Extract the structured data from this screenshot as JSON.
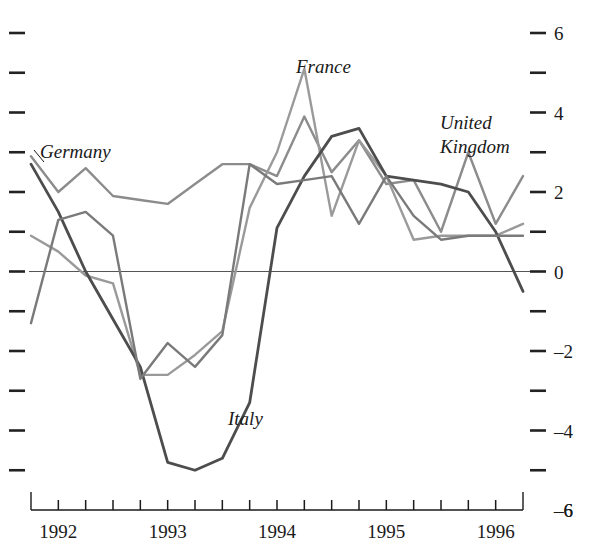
{
  "chart_data": {
    "type": "line",
    "title": "",
    "subtitle": "",
    "xlabel": "",
    "ylabel": "",
    "ylim": [
      -6,
      6
    ],
    "xlim": [
      1991.875,
      1996.375
    ],
    "grid": false,
    "legend_position": "inline-annotations",
    "y_ticks_major": [
      -6,
      -4,
      -2,
      0,
      2,
      4,
      6
    ],
    "y_ticks_minor": [
      -5,
      -3,
      -1,
      1,
      3,
      5
    ],
    "y_tick_labels": [
      "6",
      "4",
      "2",
      "0",
      "–2",
      "–4",
      "–6"
    ],
    "x_tick_labels": [
      "1992",
      "1993",
      "1994",
      "1995",
      "1996"
    ],
    "x_tick_values": [
      1992,
      1993,
      1994,
      1995,
      1996
    ],
    "x_minor_step": 0.25,
    "x": [
      1991.875,
      1992.125,
      1992.375,
      1992.625,
      1992.875,
      1993.125,
      1993.375,
      1993.625,
      1993.875,
      1994.125,
      1994.375,
      1994.625,
      1994.875,
      1995.125,
      1995.375,
      1995.625,
      1995.875,
      1996.125,
      1996.375
    ],
    "series": [
      {
        "name": "Germany",
        "color": "#8c8c8c",
        "width": 2.4,
        "values": [
          2.9,
          2.0,
          2.6,
          1.9,
          1.8,
          1.7,
          2.2,
          2.7,
          2.7,
          2.4,
          3.9,
          2.5,
          3.3,
          2.2,
          2.3,
          1.0,
          3.0,
          1.2,
          2.4
        ]
      },
      {
        "name": "France",
        "color": "#9a9a9a",
        "width": 2.4,
        "values": [
          0.9,
          0.5,
          -0.1,
          -0.3,
          -2.6,
          -2.6,
          -2.1,
          -1.5,
          1.6,
          3.0,
          5.1,
          1.4,
          3.3,
          2.4,
          0.8,
          0.9,
          0.9,
          0.9,
          1.2
        ]
      },
      {
        "name": "Italy",
        "color": "#4d4d4d",
        "width": 2.8,
        "values": [
          2.7,
          1.5,
          0.0,
          -1.2,
          -2.4,
          -4.8,
          -5.0,
          -4.7,
          -3.3,
          1.1,
          2.4,
          3.4,
          3.6,
          2.4,
          2.3,
          2.2,
          2.0,
          1.0,
          -0.5
        ]
      },
      {
        "name": "United Kingdom",
        "color": "#7a7a7a",
        "width": 2.4,
        "values": [
          -1.3,
          1.3,
          1.5,
          0.9,
          -2.7,
          -1.8,
          -2.4,
          -1.6,
          2.7,
          2.2,
          2.3,
          2.4,
          1.2,
          2.4,
          1.4,
          0.8,
          0.9,
          0.9,
          0.9
        ]
      }
    ],
    "annotations": [
      {
        "text": "Germany",
        "x": 40,
        "y": 158,
        "series": "Germany"
      },
      {
        "text": "France",
        "x": 296,
        "y": 73,
        "series": "France"
      },
      {
        "text": "Italy",
        "x": 228,
        "y": 425,
        "series": "Italy"
      },
      {
        "text": "United",
        "x": 440,
        "y": 129,
        "series": "United Kingdom"
      },
      {
        "text": "Kingdom",
        "x": 440,
        "y": 153,
        "series": "United Kingdom"
      }
    ]
  }
}
